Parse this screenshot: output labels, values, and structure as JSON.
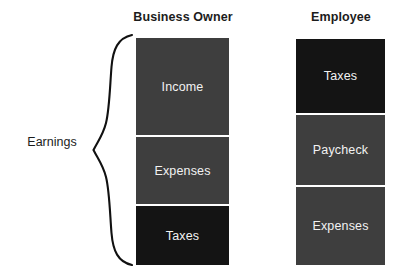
{
  "diagram": {
    "title_left": "Business Owner",
    "title_right": "Employee",
    "side_label": "Earnings",
    "brace_icon": "curly-brace-icon",
    "colors": {
      "dark_gray": "#3e3e3e",
      "near_black": "#141414",
      "text_on_block": "#f2f2f2",
      "heading_text": "#1c1c1c",
      "background": "#ffffff"
    },
    "columns": [
      {
        "name": "business-owner",
        "header": "Business Owner",
        "blocks": [
          {
            "label": "Income",
            "shade": "dark"
          },
          {
            "label": "Expenses",
            "shade": "dark"
          },
          {
            "label": "Taxes",
            "shade": "black"
          }
        ]
      },
      {
        "name": "employee",
        "header": "Employee",
        "blocks": [
          {
            "label": "Taxes",
            "shade": "black"
          },
          {
            "label": "Paycheck",
            "shade": "dark"
          },
          {
            "label": "Expenses",
            "shade": "dark"
          }
        ]
      }
    ]
  }
}
